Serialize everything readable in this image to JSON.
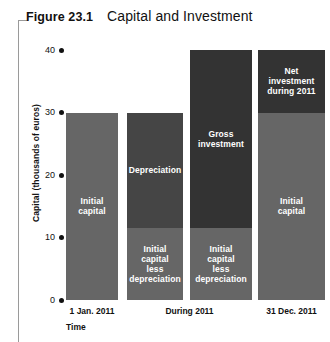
{
  "figure": {
    "number": "Figure 23.1",
    "title": "Capital and Investment"
  },
  "chart_data": {
    "type": "bar",
    "title": "Capital and Investment",
    "xlabel": "Time",
    "ylabel": "Capital (thousands of euros)",
    "ylim": [
      0,
      40
    ],
    "yticks": [
      "0",
      "10",
      "20",
      "30",
      "40"
    ],
    "ytick_values": [
      0,
      10,
      20,
      30,
      40
    ],
    "grid": false,
    "legend": "none",
    "categories": [
      "1 Jan. 2011",
      "During 2011",
      "During 2011",
      "31 Dec. 2011"
    ],
    "xtick_labels": [
      "1 Jan. 2011",
      "During 2011",
      "31 Dec. 2011"
    ],
    "bars": [
      {
        "category": "1 Jan. 2011",
        "total": 30,
        "segments": [
          {
            "label": "Initial\ncapital",
            "text": "Initial capital",
            "base": 0,
            "top": 30,
            "value": 30,
            "color": "#666666"
          }
        ]
      },
      {
        "category": "During 2011",
        "total": 30,
        "segments": [
          {
            "label": "Depreciation",
            "text": "Depreciation",
            "base": 11.5,
            "top": 30,
            "value": 18.5,
            "color": "#454545"
          },
          {
            "label": "Initial\ncapital\nless\ndepreciation",
            "text": "Initial capital less depreciation",
            "base": 0,
            "top": 11.5,
            "value": 11.5,
            "color": "#666666"
          }
        ]
      },
      {
        "category": "During 2011",
        "total": 40,
        "segments": [
          {
            "label": "Gross\ninvestment",
            "text": "Gross investment",
            "base": 11.5,
            "top": 40,
            "value": 28.5,
            "color": "#333333"
          },
          {
            "label": "Initial\ncapital\nless\ndepreciation",
            "text": "Initial capital less depreciation",
            "base": 0,
            "top": 11.5,
            "value": 11.5,
            "color": "#666666"
          }
        ]
      },
      {
        "category": "31 Dec. 2011",
        "total": 40,
        "segments": [
          {
            "label": "Net\ninvestment\nduring 2011",
            "text": "Net investment during 2011",
            "base": 30,
            "top": 40,
            "value": 10,
            "color": "#333333"
          },
          {
            "label": "Initial\ncapital",
            "text": "Initial capital",
            "base": 0,
            "top": 30,
            "value": 30,
            "color": "#666666"
          }
        ]
      }
    ]
  },
  "colors": {
    "light_gray": "#666666",
    "mid_gray": "#454545",
    "dark_gray": "#333333",
    "frame_rule": "#9a9a9a",
    "text": "#111111",
    "segment_text": "#ffffff"
  }
}
